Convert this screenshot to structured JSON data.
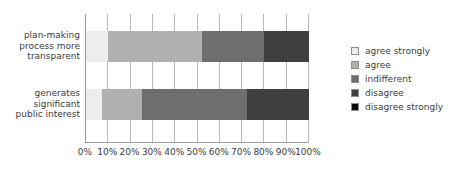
{
  "chart_data": {
    "type": "bar",
    "orientation": "horizontal",
    "stacked": true,
    "normalized_percent": true,
    "title": "",
    "xlabel": "",
    "ylabel": "",
    "xlim": [
      0,
      100
    ],
    "grid": true,
    "legend_position": "right",
    "categories": [
      "plan-making process more transparent",
      "generates significant public interest"
    ],
    "tick_labels": [
      "0%",
      "10%",
      "20%",
      "30%",
      "40%",
      "50%",
      "60%",
      "70%",
      "80%",
      "90%",
      "100%"
    ],
    "tick_values": [
      0,
      10,
      20,
      30,
      40,
      50,
      60,
      70,
      80,
      90,
      100
    ],
    "series": [
      {
        "name": "agree strongly",
        "color": "#ededed",
        "values": [
          10,
          7
        ]
      },
      {
        "name": "agree",
        "color": "#b0b0b0",
        "values": [
          42,
          18
        ]
      },
      {
        "name": "indifferent",
        "color": "#6e6e6e",
        "values": [
          28,
          47
        ]
      },
      {
        "name": "disagree",
        "color": "#3f3f3f",
        "values": [
          20,
          28
        ]
      },
      {
        "name": "disagree strongly",
        "color": "#0a0a0a",
        "values": [
          0,
          0
        ]
      }
    ]
  },
  "categories_display": [
    {
      "lines": [
        "plan-making",
        "process more",
        "transparent"
      ]
    },
    {
      "lines": [
        "generates",
        "significant",
        "public interest"
      ]
    }
  ],
  "legend": {
    "items": [
      {
        "label": "agree strongly",
        "color": "#ededed"
      },
      {
        "label": "agree",
        "color": "#b0b0b0"
      },
      {
        "label": "indifferent",
        "color": "#6e6e6e"
      },
      {
        "label": "disagree",
        "color": "#3f3f3f"
      },
      {
        "label": "disagree strongly",
        "color": "#0a0a0a"
      }
    ]
  },
  "colors": {
    "axis": "#9a9a9a",
    "gridline": "#b8b8b8",
    "text": "#3c3c3c",
    "background": "#ffffff"
  }
}
